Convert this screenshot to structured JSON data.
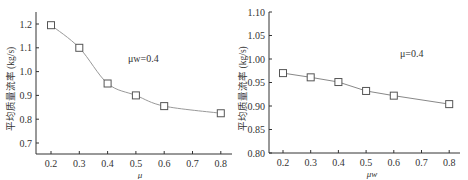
{
  "caption_fragment": "",
  "chart_data": [
    {
      "type": "line",
      "title": "",
      "xlabel": "μ",
      "ylabel": "平均质量流率 (kg/s)",
      "annotation": "μw=0.4",
      "x": [
        0.2,
        0.3,
        0.4,
        0.5,
        0.6,
        0.8
      ],
      "values": [
        1.195,
        1.1,
        0.95,
        0.9,
        0.855,
        0.825
      ],
      "xticks": [
        "0.2",
        "0.3",
        "0.4",
        "0.5",
        "0.6",
        "0.7",
        "0.8"
      ],
      "yticks": [
        "0.7",
        "0.8",
        "0.9",
        "1.0",
        "1.1",
        "1.2"
      ],
      "xlim": [
        0.15,
        0.85
      ],
      "ylim": [
        0.65,
        1.25
      ],
      "smooth": true,
      "marker": "open-square",
      "grid": false
    },
    {
      "type": "line",
      "title": "",
      "xlabel": "μw",
      "ylabel": "平均质量流率 (kg/s)",
      "annotation": "μ=0.4",
      "x": [
        0.2,
        0.3,
        0.4,
        0.5,
        0.6,
        0.8
      ],
      "values": [
        0.97,
        0.961,
        0.951,
        0.932,
        0.922,
        0.904
      ],
      "xticks": [
        "0.2",
        "0.3",
        "0.4",
        "0.5",
        "0.6",
        "0.7",
        "0.8"
      ],
      "yticks": [
        "0.80",
        "0.85",
        "0.90",
        "0.95",
        "1.00",
        "1.05",
        "1.10"
      ],
      "xlim": [
        0.15,
        0.85
      ],
      "ylim": [
        0.8,
        1.1
      ],
      "smooth": false,
      "marker": "open-square",
      "grid": false
    }
  ]
}
